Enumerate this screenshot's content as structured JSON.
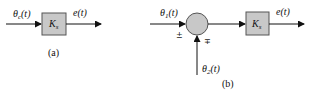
{
  "diagram_a": {
    "input_label": "θ",
    "input_sub": "c",
    "input_arg": "(t)",
    "block_label": "K",
    "block_sub": "s",
    "output_label": "e(t)",
    "caption": "(a)"
  },
  "diagram_b": {
    "input1_label": "θ",
    "input1_sub": "1",
    "input1_arg": "(t)",
    "input1_sign": "±",
    "input2_label": "θ",
    "input2_sub": "2",
    "input2_arg": "(t)",
    "input2_sign": "∓",
    "summing_junction": "summing-junction",
    "block_label": "K",
    "block_sub": "s",
    "output_label": "e(t)",
    "caption": "(b)"
  },
  "colors": {
    "block_fill": "#c8c8c8",
    "junction_fill": "#c8c8c8",
    "stroke": "#111111"
  }
}
